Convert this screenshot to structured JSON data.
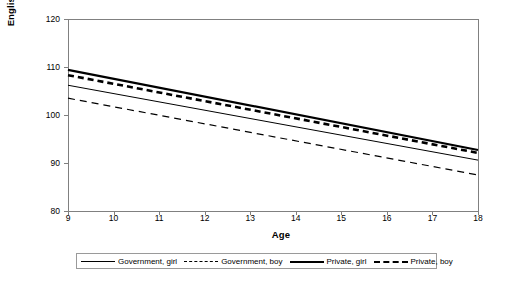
{
  "chart_data": {
    "type": "line",
    "title": "",
    "xlabel": "Age",
    "ylabel": "English standardised score",
    "xlim": [
      9,
      18
    ],
    "ylim": [
      80,
      120
    ],
    "xticks": [
      9,
      10,
      11,
      12,
      13,
      14,
      15,
      16,
      17,
      18
    ],
    "yticks": [
      80,
      90,
      100,
      110,
      120
    ],
    "grid": false,
    "legend_position": "bottom",
    "x": [
      9,
      18
    ],
    "series": [
      {
        "name": "Government, girl",
        "style": "thin-solid",
        "values": [
          106.2,
          90.6
        ]
      },
      {
        "name": "Government, boy",
        "style": "thin-dash",
        "values": [
          103.5,
          87.5
        ]
      },
      {
        "name": "Private, girl",
        "style": "thick-solid",
        "values": [
          109.4,
          92.7
        ]
      },
      {
        "name": "Private, boy",
        "style": "thick-dash",
        "values": [
          108.3,
          92.1
        ]
      }
    ]
  },
  "axes": {
    "y_title": "English standardised score",
    "x_title": "Age",
    "y_tick_labels": [
      "120",
      "110",
      "100",
      "90",
      "80"
    ],
    "x_tick_labels": [
      "9",
      "10",
      "11",
      "12",
      "13",
      "14",
      "15",
      "16",
      "17",
      "18"
    ]
  },
  "legend": {
    "entries": [
      {
        "label": "Government, girl"
      },
      {
        "label": "Government, boy"
      },
      {
        "label": "Private, girl"
      },
      {
        "label": "Private, boy"
      }
    ]
  },
  "colors": {
    "line": "#000000",
    "frame": "#808080",
    "legend_border": "#9a9a9a",
    "background": "#ffffff"
  }
}
